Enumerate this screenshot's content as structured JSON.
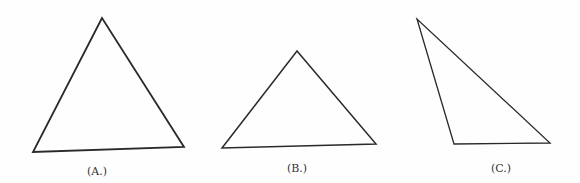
{
  "figures": [
    {
      "id": "A",
      "label": "(A.)",
      "points": [
        [
          102,
          18
        ],
        [
          33,
          152
        ],
        [
          184,
          147
        ]
      ],
      "label_pos": [
        97,
        165
      ],
      "stroke_width": 1.8
    },
    {
      "id": "B",
      "label": "(B.)",
      "points": [
        [
          297,
          51
        ],
        [
          222,
          148
        ],
        [
          376,
          144
        ]
      ],
      "label_pos": [
        297,
        162
      ],
      "stroke_width": 1.5
    },
    {
      "id": "C",
      "label": "(C.)",
      "points": [
        [
          417,
          19
        ],
        [
          454,
          144
        ],
        [
          550,
          143
        ]
      ],
      "label_pos": [
        501,
        162
      ],
      "stroke_width": 1.3
    }
  ],
  "colors": {
    "stroke": "#2a2a2a",
    "background": "#fefefe"
  }
}
